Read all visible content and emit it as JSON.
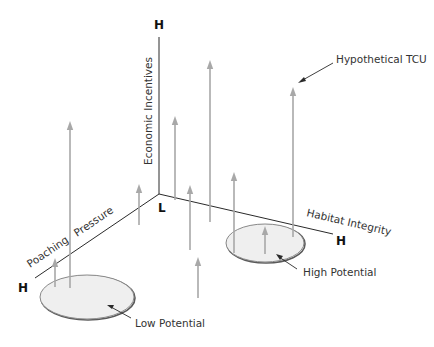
{
  "axes": {
    "vertical": {
      "label": "Economic Incentives",
      "high_label": "H"
    },
    "origin": {
      "label": "L"
    },
    "left": {
      "label_part1": "Poaching",
      "label_part2": "Pressure",
      "high_label": "H"
    },
    "right": {
      "label": "Habitat Integrity",
      "high_label": "H"
    }
  },
  "annotations": {
    "tcu": "Hypothetical TCU",
    "high_potential": "High Potential",
    "low_potential": "Low Potential"
  },
  "arrows": [
    {
      "x": 70,
      "top": 121,
      "bottom": 288
    },
    {
      "x": 55,
      "top": 258,
      "bottom": 287
    },
    {
      "x": 139,
      "top": 184,
      "bottom": 225
    },
    {
      "x": 175,
      "top": 116,
      "bottom": 200
    },
    {
      "x": 190,
      "top": 185,
      "bottom": 250
    },
    {
      "x": 210,
      "top": 60,
      "bottom": 222
    },
    {
      "x": 198,
      "top": 257,
      "bottom": 298
    },
    {
      "x": 234,
      "top": 172,
      "bottom": 253
    },
    {
      "x": 265,
      "top": 226,
      "bottom": 254
    },
    {
      "x": 293,
      "top": 87,
      "bottom": 237
    }
  ],
  "colors": {
    "arrow": "#a8a8a8",
    "axis": "#2a2a2a",
    "ellipse_fill": "#efefef"
  }
}
